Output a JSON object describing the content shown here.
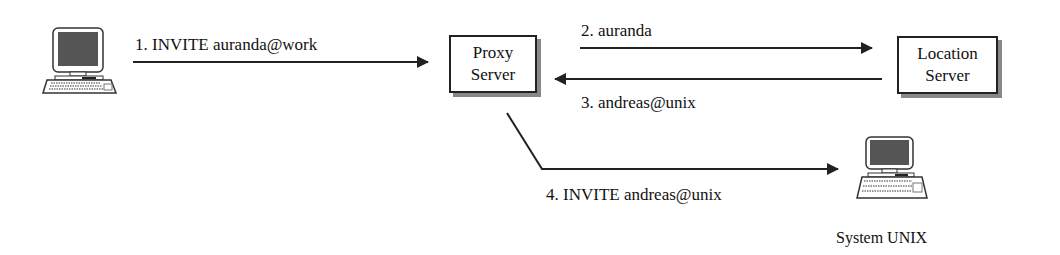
{
  "diagram": {
    "nodes": {
      "caller": {
        "label": ""
      },
      "proxy": {
        "line1": "Proxy",
        "line2": "Server"
      },
      "location": {
        "line1": "Location",
        "line2": "Server"
      },
      "unix": {
        "label": "System UNIX"
      }
    },
    "messages": [
      {
        "step": 1,
        "label": "1. INVITE auranda@work"
      },
      {
        "step": 2,
        "label": "2. auranda"
      },
      {
        "step": 3,
        "label": "3. andreas@unix"
      },
      {
        "step": 4,
        "label": "4. INVITE andreas@unix"
      }
    ],
    "colors": {
      "line": "#222222",
      "shadow": "#888888",
      "screen": "#555555"
    }
  }
}
